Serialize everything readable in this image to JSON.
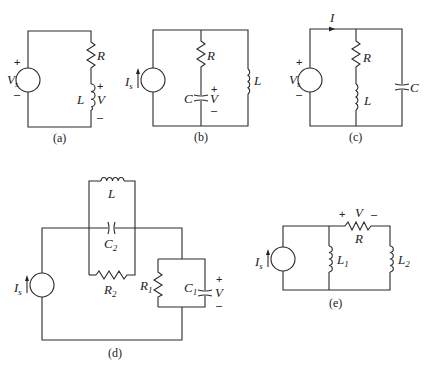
{
  "figure": {
    "panels": [
      {
        "id": "a",
        "caption": "(a)",
        "source": {
          "type": "voltage",
          "label": "V",
          "sub": "s",
          "plus": "+",
          "minus": "–"
        },
        "components": [
          {
            "type": "resistor",
            "label": "R"
          },
          {
            "type": "inductor",
            "label": "L",
            "voltage_label": "V",
            "plus": "+",
            "minus": "–"
          }
        ],
        "topology": "series"
      },
      {
        "id": "b",
        "caption": "(b)",
        "source": {
          "type": "current",
          "label": "I",
          "sub": "s"
        },
        "components": [
          {
            "type": "resistor",
            "label": "R"
          },
          {
            "type": "capacitor",
            "label": "C",
            "voltage_label": "V",
            "plus": "+",
            "minus": "–"
          },
          {
            "type": "inductor",
            "label": "L"
          }
        ],
        "topology": "source || (R series C) || L"
      },
      {
        "id": "c",
        "caption": "(c)",
        "source": {
          "type": "voltage",
          "label": "V",
          "sub": "s",
          "plus": "+",
          "minus": "–"
        },
        "current_label": "I",
        "components": [
          {
            "type": "resistor",
            "label": "R"
          },
          {
            "type": "inductor",
            "label": "L"
          },
          {
            "type": "capacitor",
            "label": "C"
          }
        ],
        "topology": "source || (R series L) || C"
      },
      {
        "id": "d",
        "caption": "(d)",
        "source": {
          "type": "current",
          "label": "I",
          "sub": "s"
        },
        "components": [
          {
            "type": "inductor",
            "label": "L"
          },
          {
            "type": "capacitor",
            "label": "C",
            "sub": "2"
          },
          {
            "type": "resistor",
            "label": "R",
            "sub": "2"
          },
          {
            "type": "resistor",
            "label": "R",
            "sub": "1"
          },
          {
            "type": "capacitor",
            "label": "C",
            "sub": "1",
            "voltage_label": "V",
            "plus": "+",
            "minus": "–"
          }
        ],
        "topology": "source -> (L || C2 || R2) -> (R1 || C1)"
      },
      {
        "id": "e",
        "caption": "(e)",
        "source": {
          "type": "current",
          "label": "I",
          "sub": "s"
        },
        "components": [
          {
            "type": "inductor",
            "label": "L",
            "sub": "1"
          },
          {
            "type": "resistor",
            "label": "R",
            "voltage_label": "V",
            "plus": "+",
            "minus": "–"
          },
          {
            "type": "inductor",
            "label": "L",
            "sub": "2"
          }
        ],
        "topology": "source || L1 || (R series L2)"
      }
    ]
  }
}
